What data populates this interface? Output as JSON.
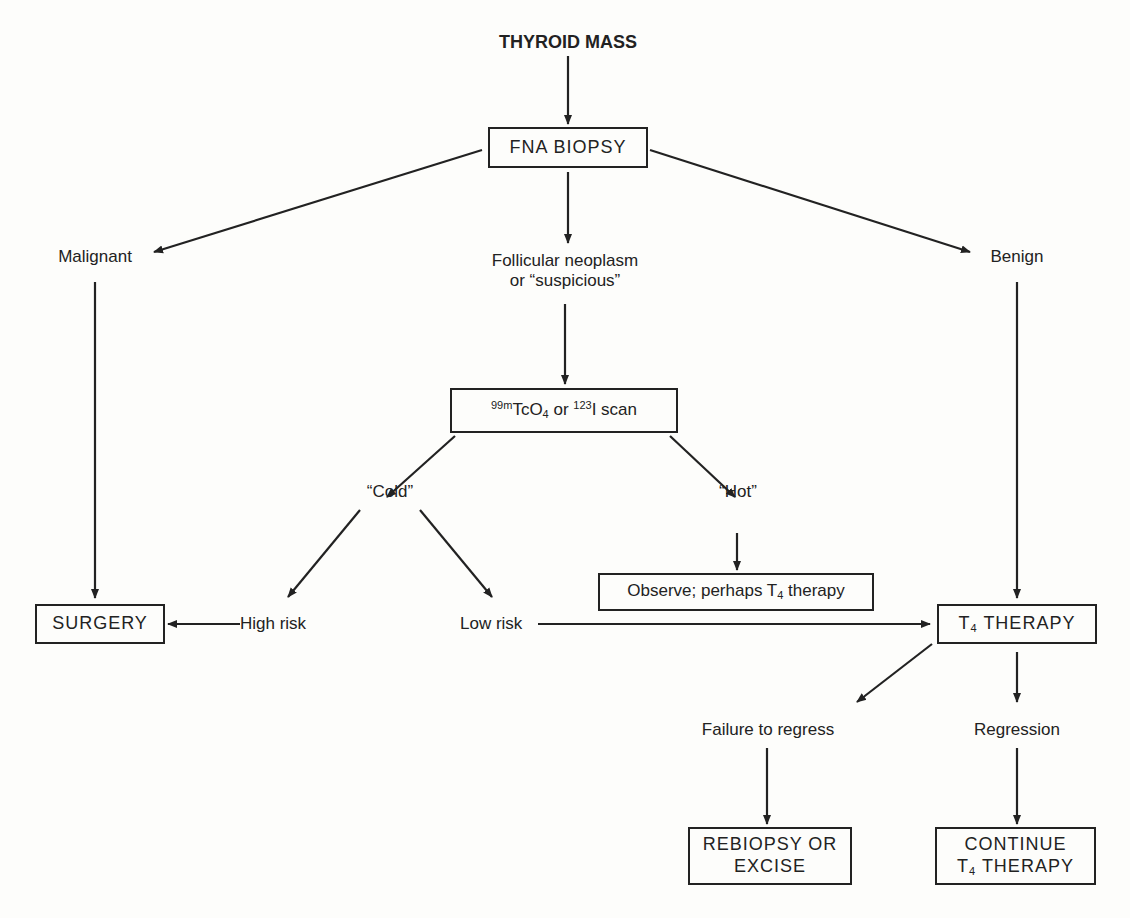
{
  "diagram": {
    "type": "flowchart",
    "nodes": {
      "thyroid_mass": "THYROID MASS",
      "fna_biopsy": "FNA BIOPSY",
      "malignant": "Malignant",
      "follicular_line1": "Follicular neoplasm",
      "follicular_line2": "or “suspicious”",
      "benign": "Benign",
      "scan": {
        "sup1": "99m",
        "part1": "TcO",
        "sub1": "4",
        "part2": " or ",
        "sup2": "123",
        "part3": "I scan"
      },
      "cold": "“Cold”",
      "hot": "“Hot”",
      "observe": {
        "part1": "Observe; perhaps T",
        "sub": "4",
        "part2": " therapy"
      },
      "surgery": "SURGERY",
      "high_risk": "High risk",
      "low_risk": "Low risk",
      "t4_therapy": {
        "part1": "T",
        "sub": "4",
        "part2": " THERAPY"
      },
      "failure_to_regress": "Failure to regress",
      "regression": "Regression",
      "rebiopsy_line1": "REBIOPSY OR",
      "rebiopsy_line2": "EXCISE",
      "continue_line1": "CONTINUE",
      "continue_line2": {
        "part1": "T",
        "sub": "4",
        "part2": " THERAPY"
      }
    },
    "edges": [
      {
        "from": "THYROID MASS",
        "to": "FNA BIOPSY"
      },
      {
        "from": "FNA BIOPSY",
        "to": "Malignant"
      },
      {
        "from": "FNA BIOPSY",
        "to": "Follicular neoplasm or suspicious"
      },
      {
        "from": "FNA BIOPSY",
        "to": "Benign"
      },
      {
        "from": "Malignant",
        "to": "SURGERY"
      },
      {
        "from": "Follicular neoplasm or suspicious",
        "to": "99mTcO4 or 123I scan"
      },
      {
        "from": "99mTcO4 or 123I scan",
        "to": "Cold"
      },
      {
        "from": "99mTcO4 or 123I scan",
        "to": "Hot"
      },
      {
        "from": "Hot",
        "to": "Observe; perhaps T4 therapy"
      },
      {
        "from": "Cold",
        "to": "High risk"
      },
      {
        "from": "Cold",
        "to": "Low risk"
      },
      {
        "from": "High risk",
        "to": "SURGERY"
      },
      {
        "from": "Low risk",
        "to": "T4 THERAPY"
      },
      {
        "from": "Benign",
        "to": "T4 THERAPY"
      },
      {
        "from": "T4 THERAPY",
        "to": "Failure to regress"
      },
      {
        "from": "T4 THERAPY",
        "to": "Regression"
      },
      {
        "from": "Failure to regress",
        "to": "REBIOPSY OR EXCISE"
      },
      {
        "from": "Regression",
        "to": "CONTINUE T4 THERAPY"
      }
    ]
  }
}
